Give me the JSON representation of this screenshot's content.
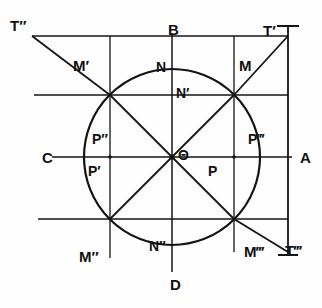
{
  "figure": {
    "stroke_color": "#141414",
    "background_color": "#fefefe",
    "canvas": {
      "width": 322,
      "height": 308
    }
  },
  "geometry": {
    "center": {
      "x": 172,
      "y": 157
    },
    "radius": 88,
    "axis_left_x": 84,
    "axis_right_x": 260,
    "axis_top_y": 69,
    "axis_bottom_y": 245,
    "diagonal_angle_deg": 45
  },
  "labels": {
    "center": "Θ",
    "axis_right": "A",
    "axis_top": "B",
    "axis_left": "C",
    "axis_bottom": "D",
    "point_m": "M",
    "point_m_prime": "M′",
    "point_m_double_prime": "M″",
    "point_m_triple_prime": "M‴",
    "tangent_t_prime": "T′",
    "tangent_t_double_prime": "T″",
    "tangent_t_triple_prime": "T‴",
    "foot_n": "N",
    "foot_n_prime": "N′",
    "foot_n_double_prime": "N″",
    "proj_p": "P",
    "proj_p_prime": "P′",
    "proj_p_double_prime": "P″",
    "proj_p_triple_prime": "P‴"
  },
  "label_positions": {
    "tangent_t_double_prime": {
      "x": 10,
      "y": 18
    },
    "tangent_t_prime": {
      "x": 263,
      "y": 23
    },
    "tangent_t_triple_prime": {
      "x": 285,
      "y": 243
    },
    "axis_top": {
      "x": 168,
      "y": 22
    },
    "axis_right": {
      "x": 300,
      "y": 150
    },
    "axis_left": {
      "x": 42,
      "y": 150
    },
    "axis_bottom": {
      "x": 170,
      "y": 277
    },
    "point_m": {
      "x": 239,
      "y": 58
    },
    "point_m_prime": {
      "x": 73,
      "y": 58
    },
    "point_m_double_prime": {
      "x": 79,
      "y": 249
    },
    "point_m_triple_prime": {
      "x": 244,
      "y": 244
    },
    "foot_n": {
      "x": 156,
      "y": 60
    },
    "foot_n_prime": {
      "x": 172,
      "y": 86
    },
    "foot_n_double_prime": {
      "x": 149,
      "y": 239
    },
    "center": {
      "x": 178,
      "y": 148
    },
    "proj_p": {
      "x": 208,
      "y": 164
    },
    "proj_p_prime": {
      "x": 88,
      "y": 164
    },
    "proj_p_double_prime": {
      "x": 92,
      "y": 132
    },
    "proj_p_triple_prime": {
      "x": 248,
      "y": 132
    }
  }
}
